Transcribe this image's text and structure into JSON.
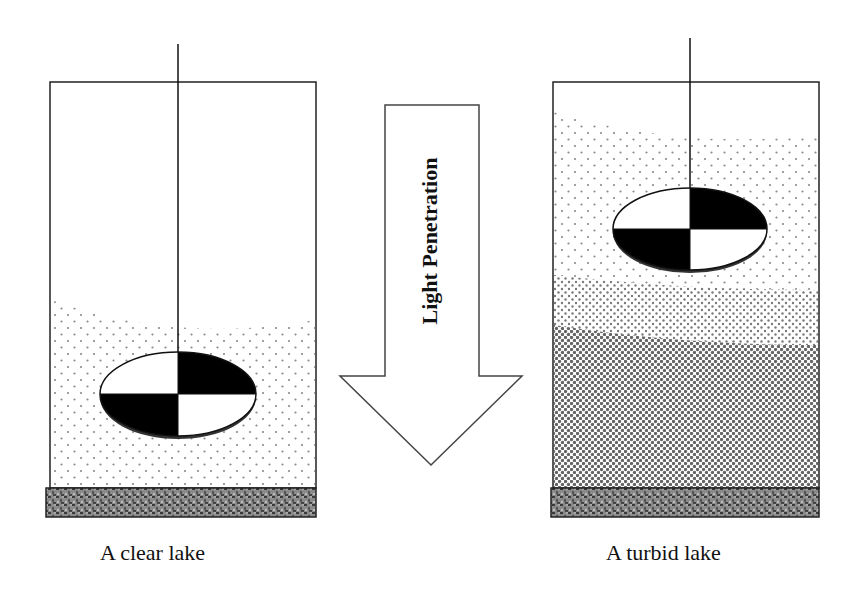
{
  "diagram": {
    "type": "comparison",
    "topic": "Secchi disk depth and light penetration in lakes",
    "panels": [
      {
        "id": "clear",
        "caption": "A clear lake",
        "water": "sparse particles, starting mid-depth",
        "secchi_disk_position": "deep (near bottom)"
      },
      {
        "id": "turbid",
        "caption": "A turbid lake",
        "water": "dense particles increasing with depth",
        "secchi_disk_position": "shallow (near top)"
      }
    ],
    "arrow": {
      "label": "Light Penetration",
      "direction": "down"
    }
  },
  "colors": {
    "outline": "#222222",
    "disk_dark": "#000000",
    "disk_light": "#ffffff",
    "sediment": "#6e6e6e",
    "particles": "#777777"
  }
}
